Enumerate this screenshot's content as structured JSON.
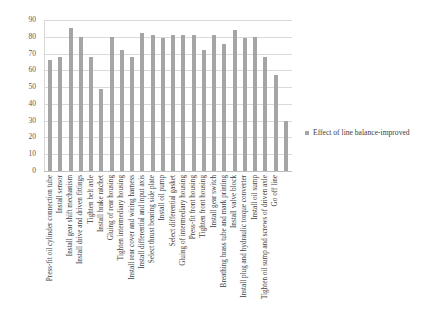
{
  "chart_data": {
    "type": "bar",
    "title": "",
    "xlabel": "",
    "ylabel": "",
    "ylim": [
      0,
      90
    ],
    "ytick_step": 10,
    "yticks": [
      0,
      10,
      20,
      30,
      40,
      50,
      60,
      70,
      80,
      90
    ],
    "grid": true,
    "legend_position": "right",
    "bar_color": "#A5A5A5",
    "series": [
      {
        "name": "Effect of line balance-improved",
        "values": [
          66,
          68,
          85,
          80,
          68,
          49,
          80,
          72,
          68,
          82,
          81,
          79,
          81,
          81,
          81,
          72,
          81,
          76,
          84,
          79,
          80,
          68,
          57,
          30
        ]
      }
    ],
    "categories": [
      "Press-fit oil cylinder connection tube",
      "Install sensor",
      "Install gear shift mechanism",
      "Install drive and driven fittings",
      "Tighten belt axle",
      "Install brake ratchet",
      "Gluing of rear housing",
      "Tighten intermediary housing",
      "Install rear cover and wiring harness",
      "Install differential and input axis",
      "Select thrust bearing side plate",
      "Install oil pump",
      "Select differential gasket",
      "Gluing of intermediary housing",
      "Press-fit front housing",
      "Tighten front housing",
      "Install gear switch",
      "Breathing brass tube and mark printing",
      "Install valve block",
      "Install plug and hydraulic torque converter",
      "Install oil sump",
      "Tighten oil sump and screws of driven axle",
      "Go off line",
      ""
    ]
  },
  "legend": {
    "entries": [
      {
        "label": "Effect of line balance-improved",
        "color": "#A5A5A5",
        "marker": "legend-swatch-icon"
      }
    ]
  }
}
